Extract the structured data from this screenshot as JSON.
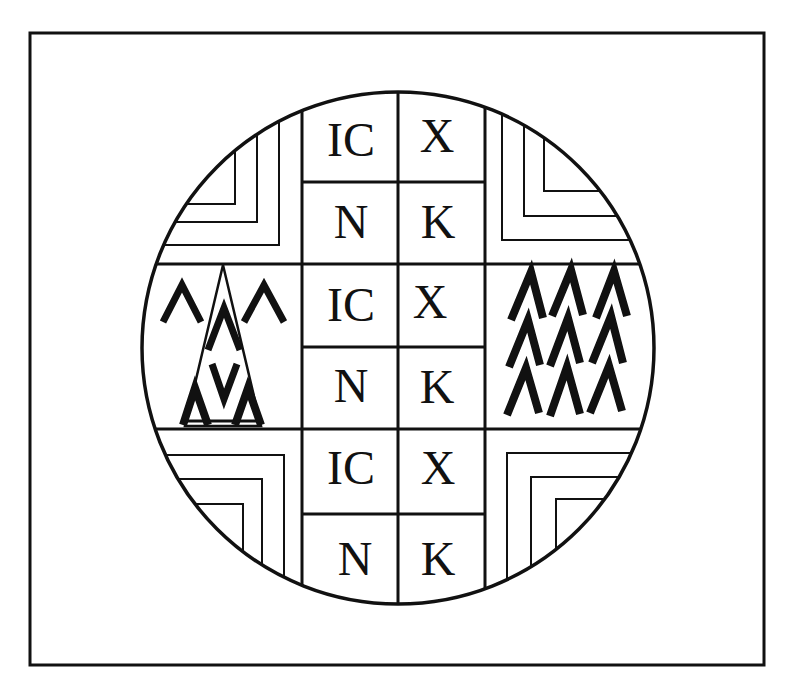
{
  "figure": {
    "frame": {
      "x": 30,
      "y": 33,
      "width": 734,
      "height": 632
    },
    "circle": {
      "cx": 398,
      "cy": 348,
      "r": 256
    },
    "grid": {
      "columns_x": [
        302,
        398,
        485
      ],
      "rows_y": [
        182,
        264,
        347,
        429,
        514
      ]
    },
    "center_cells": [
      {
        "row": 0,
        "left": "IC",
        "right": "X"
      },
      {
        "row": 1,
        "left": "N",
        "right": "K"
      },
      {
        "row": 2,
        "left": "IC",
        "right": "X"
      },
      {
        "row": 3,
        "left": "N",
        "right": "K"
      },
      {
        "row": 4,
        "left": "IC",
        "right": "X"
      },
      {
        "row": 5,
        "left": "N",
        "right": "K"
      }
    ],
    "quadrants": {
      "top_left": "nested-corner-lines",
      "top_right": "nested-corner-lines",
      "bottom_left": "nested-corner-lines",
      "bottom_right": "nested-corner-lines"
    },
    "left_panel": {
      "motif": "chevron-triangle-pattern",
      "glyphs": [
        "Λ",
        "Λ",
        "Λ",
        "V",
        "Λ",
        "Λ"
      ]
    },
    "right_panel": {
      "motif": "chevron-grid-3x3",
      "rows": 3,
      "cols": 3,
      "glyph": "Λ"
    },
    "colors": {
      "line": "#111111",
      "background": "#ffffff"
    }
  }
}
